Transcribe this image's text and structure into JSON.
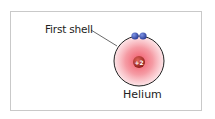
{
  "diagram": {
    "title": "Helium",
    "shell_label": "First shell",
    "nucleus_charge": "+2",
    "electrons": 2,
    "colors": {
      "electron": "#3b55b8",
      "nucleus": "#b5332b",
      "electron_cloud": "#f0596a",
      "shell_outline": "#222222",
      "frame": "#c9c9c9"
    }
  }
}
